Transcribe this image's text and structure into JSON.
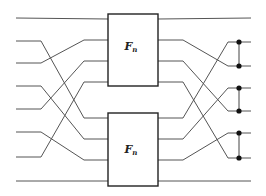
{
  "diagram": {
    "blocks": [
      {
        "id": "top",
        "label_main": "F",
        "label_sub": "n",
        "x": 108,
        "y": 14,
        "w": 50,
        "h": 72,
        "label_x": 131,
        "label_y": 47
      },
      {
        "id": "bottom",
        "label_main": "F",
        "label_sub": "n",
        "x": 108,
        "y": 113,
        "w": 50,
        "h": 73,
        "label_x": 131,
        "label_y": 150
      }
    ],
    "colors": {
      "wire": "#555555",
      "box": "#222222",
      "dot": "#111111",
      "background": "#ffffff"
    },
    "left_inputs_y": [
      18,
      41,
      63,
      86,
      109,
      132,
      157,
      181
    ],
    "top_pins_y": [
      19,
      40,
      61,
      82
    ],
    "bottom_pins_y": [
      118,
      139,
      160,
      181
    ],
    "right_outputs_y": [
      18,
      42,
      66,
      88,
      111,
      133,
      158,
      181
    ],
    "left_wires": [
      {
        "from_y": 18,
        "to_y": 19
      },
      {
        "from_y": 41,
        "to_y": 118
      },
      {
        "from_y": 63,
        "to_y": 40
      },
      {
        "from_y": 86,
        "to_y": 139
      },
      {
        "from_y": 109,
        "to_y": 61
      },
      {
        "from_y": 132,
        "to_y": 160
      },
      {
        "from_y": 157,
        "to_y": 82
      },
      {
        "from_y": 181,
        "to_y": 181
      }
    ],
    "right_wires": [
      {
        "from_y": 19,
        "to_y": 18
      },
      {
        "from_y": 40,
        "to_y": 66
      },
      {
        "from_y": 61,
        "to_y": 111
      },
      {
        "from_y": 82,
        "to_y": 158
      },
      {
        "from_y": 118,
        "to_y": 42
      },
      {
        "from_y": 139,
        "to_y": 88
      },
      {
        "from_y": 160,
        "to_y": 133
      },
      {
        "from_y": 181,
        "to_y": 181
      }
    ],
    "dot_pairs": [
      [
        42,
        66
      ],
      [
        88,
        111
      ],
      [
        133,
        158
      ]
    ],
    "dot_x": 239
  }
}
